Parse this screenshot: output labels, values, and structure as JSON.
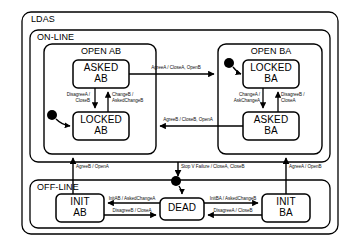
{
  "diagram": {
    "type": "uml-statechart",
    "title_visible": false,
    "colors": {
      "stroke": "#000000",
      "fill": "#ffffff",
      "text": "#000000",
      "initial_marker": "#000000"
    },
    "regions": [
      {
        "id": "ldas",
        "label": "LDAS"
      },
      {
        "id": "online",
        "label": "ON-LINE"
      },
      {
        "id": "offline",
        "label": "OFF-LINE"
      }
    ],
    "composites": [
      {
        "id": "open_ab",
        "label": "OPEN AB"
      },
      {
        "id": "open_ba",
        "label": "OPEN BA"
      }
    ],
    "states": [
      {
        "id": "asked_ab",
        "line1": "ASKED",
        "line2": "AB"
      },
      {
        "id": "locked_ab",
        "line1": "LOCKED",
        "line2": "AB"
      },
      {
        "id": "locked_ba",
        "line1": "LOCKED",
        "line2": "BA"
      },
      {
        "id": "asked_ba",
        "line1": "ASKED",
        "line2": "BA"
      },
      {
        "id": "init_ab",
        "line1": "INIT",
        "line2": "AB"
      },
      {
        "id": "init_ba",
        "line1": "INIT",
        "line2": "BA"
      },
      {
        "id": "dead",
        "line1": "DEAD",
        "line2": ""
      }
    ],
    "transitions": [
      {
        "id": "t_askedab_to_openba",
        "label": "AgreeA / CloseA, OpenB"
      },
      {
        "id": "t_askedab_to_lockedab",
        "label_line1": "DisagreeA /",
        "label_line2": "CloseB"
      },
      {
        "id": "t_lockedab_to_askedab",
        "label_line1": "ChangeB /",
        "label_line2": "AskedChangeB"
      },
      {
        "id": "t_lockedba_to_askedba",
        "label_line1": "ChangeA /",
        "label_line2": "AskChangeA"
      },
      {
        "id": "t_askedba_to_lockedba",
        "label_line1": "DisagreeB /",
        "label_line2": "CloseA"
      },
      {
        "id": "t_askedba_to_openab",
        "label": "AgreeB / CloseB, OpenA"
      },
      {
        "id": "t_initab_to_openab",
        "label": "AgreeB / OpenA"
      },
      {
        "id": "t_online_to_dead",
        "label": "Stop V Failure / CloseA, CloseB"
      },
      {
        "id": "t_initba_to_openba",
        "label": "AgreeA / OpenB"
      },
      {
        "id": "t_dead_to_initab",
        "label": "InitAB / AskedChangeA"
      },
      {
        "id": "t_initab_to_dead",
        "label": "DisagreeB / CloseA"
      },
      {
        "id": "t_dead_to_initba",
        "label": "InitBA / AskedChangeB"
      },
      {
        "id": "t_initba_to_dead",
        "label": "DisagreeA / CloseB"
      }
    ],
    "initial_markers": [
      {
        "id": "init_marker_locked_ab",
        "target": "locked_ab"
      },
      {
        "id": "init_marker_locked_ba",
        "target": "locked_ba"
      },
      {
        "id": "init_marker_dead",
        "target": "dead"
      }
    ]
  }
}
